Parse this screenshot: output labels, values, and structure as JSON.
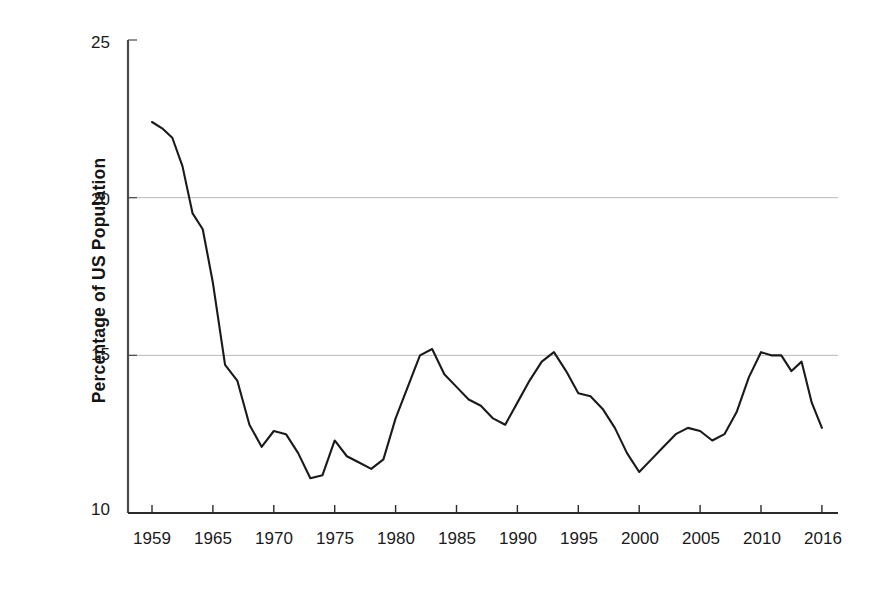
{
  "chart_data": {
    "type": "line",
    "title": "",
    "xlabel": "",
    "ylabel": "Percentage of US Population",
    "ylim": [
      10,
      25
    ],
    "yticks": [
      10,
      15,
      20,
      25
    ],
    "ytick_labels": [
      "10",
      "15",
      "20",
      "25"
    ],
    "xtick_labels": [
      "1959",
      "1965",
      "1970",
      "1975",
      "1980",
      "1985",
      "1990",
      "1995",
      "2000",
      "2005",
      "2010",
      "2016"
    ],
    "xlim": [
      1959,
      2016
    ],
    "grid": "horizontal-gridlines-at-15-and-20",
    "legend": "none",
    "line_color": "#1a1a1a",
    "series": [
      {
        "name": "Percentage of US Population in Poverty",
        "x": [
          1959,
          1960,
          1961,
          1962,
          1963,
          1964,
          1965,
          1966,
          1967,
          1968,
          1969,
          1970,
          1971,
          1972,
          1973,
          1974,
          1975,
          1976,
          1977,
          1978,
          1979,
          1980,
          1981,
          1982,
          1983,
          1984,
          1985,
          1986,
          1987,
          1988,
          1989,
          1990,
          1991,
          1992,
          1993,
          1994,
          1995,
          1996,
          1997,
          1998,
          1999,
          2000,
          2001,
          2002,
          2003,
          2004,
          2005,
          2006,
          2007,
          2008,
          2009,
          2010,
          2011,
          2012,
          2013,
          2014,
          2015,
          2016
        ],
        "values": [
          22.4,
          22.2,
          21.9,
          21.0,
          19.5,
          19.0,
          17.3,
          14.7,
          14.2,
          12.8,
          12.1,
          12.6,
          12.5,
          11.9,
          11.1,
          11.2,
          12.3,
          11.8,
          11.6,
          11.4,
          11.7,
          13.0,
          14.0,
          15.0,
          15.2,
          14.4,
          14.0,
          13.6,
          13.4,
          13.0,
          12.8,
          13.5,
          14.2,
          14.8,
          15.1,
          14.5,
          13.8,
          13.7,
          13.3,
          12.7,
          11.9,
          11.3,
          11.7,
          12.1,
          12.5,
          12.7,
          12.6,
          12.3,
          12.5,
          13.2,
          14.3,
          15.1,
          15.0,
          15.0,
          14.5,
          14.8,
          13.5,
          12.7
        ]
      }
    ],
    "annotations": {
      "peak_start": 22.4,
      "peak_start_year": 1959,
      "peak_1983": 15.2,
      "peak_1993": 15.1,
      "peak_2010": 15.1,
      "trough_1973": 11.1,
      "trough_2000": 11.3,
      "final_value": 12.7,
      "final_year": 2016
    }
  }
}
